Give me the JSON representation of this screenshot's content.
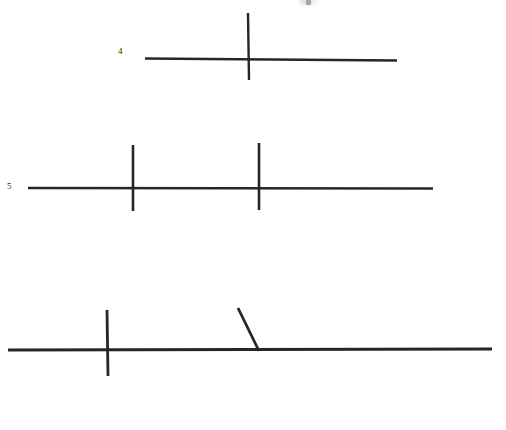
{
  "page": {
    "width": 506,
    "height": 430,
    "background_color": "#ffffff",
    "ink_color": "#262626",
    "document_type": "scanned-line-figures"
  },
  "labels": [
    {
      "id": "label-4",
      "text": "4",
      "x": 118,
      "y": 47
    },
    {
      "id": "label-5",
      "text": "5",
      "x": 7,
      "y": 182
    }
  ],
  "artifacts": [
    {
      "name": "top-edge-smudge",
      "description": "faint partially-cropped ink mark at the top edge",
      "x": 306,
      "y": 0,
      "width": 5,
      "height": 5,
      "color": "#6f6f6f",
      "opacity": 0.55
    }
  ],
  "figures": [
    {
      "name": "figure-4",
      "label": "4",
      "description": "horizontal baseline crossed by one vertical stroke right of centre",
      "strokes": [
        {
          "name": "baseline",
          "type": "line",
          "x1": 145,
          "y1": 58.5,
          "x2": 397,
          "y2": 60.5,
          "width": 2.6
        },
        {
          "name": "vertical-tick",
          "type": "line",
          "x1": 248,
          "y1": 13,
          "x2": 249,
          "y2": 80,
          "width": 2.4
        }
      ]
    },
    {
      "name": "figure-5",
      "label": "5",
      "description": "horizontal baseline crossed by two vertical strokes",
      "strokes": [
        {
          "name": "baseline",
          "type": "line",
          "x1": 28,
          "y1": 188,
          "x2": 433,
          "y2": 188.5,
          "width": 2.6
        },
        {
          "name": "vertical-tick-left",
          "type": "line",
          "x1": 133,
          "y1": 145,
          "x2": 133,
          "y2": 211,
          "width": 2.6
        },
        {
          "name": "vertical-tick-right",
          "type": "line",
          "x1": 259,
          "y1": 143,
          "x2": 259,
          "y2": 210,
          "width": 2.6
        }
      ]
    },
    {
      "name": "figure-unlabeled",
      "label": "",
      "description": "long horizontal baseline with one vertical stroke and one oblique stroke meeting the baseline",
      "strokes": [
        {
          "name": "baseline",
          "type": "line",
          "x1": 8,
          "y1": 350,
          "x2": 492,
          "y2": 349,
          "width": 2.8
        },
        {
          "name": "vertical-tick",
          "type": "line",
          "x1": 107,
          "y1": 310,
          "x2": 108,
          "y2": 376,
          "width": 2.8
        },
        {
          "name": "oblique-stroke",
          "type": "line",
          "x1": 238,
          "y1": 308,
          "x2": 259,
          "y2": 351,
          "width": 2.8
        }
      ]
    }
  ]
}
